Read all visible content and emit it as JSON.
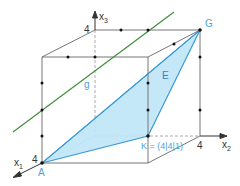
{
  "figure": {
    "type": "3d-coordinate-diagram",
    "axes": {
      "x1": {
        "label": "x",
        "subscript": "1",
        "tick": "4"
      },
      "x2": {
        "label": "x",
        "subscript": "2",
        "tick": "4"
      },
      "x3": {
        "label": "x",
        "subscript": "3",
        "tick": "4"
      }
    },
    "points": {
      "A": {
        "label": "A"
      },
      "G": {
        "label": "G"
      },
      "K": {
        "label": "K",
        "coords_text": "K = (4|4|1)"
      }
    },
    "plane": {
      "label": "E",
      "color": "#bfe6f7",
      "edge_color": "#3a9ad4"
    },
    "line": {
      "label": "g",
      "color": "#3f8f3a"
    },
    "colors": {
      "cube_edges": "#777777",
      "dashed": "#aaaaaa",
      "point_labels": "#4aa3dc",
      "axis_text": "#333333",
      "dots": "#111111"
    }
  }
}
